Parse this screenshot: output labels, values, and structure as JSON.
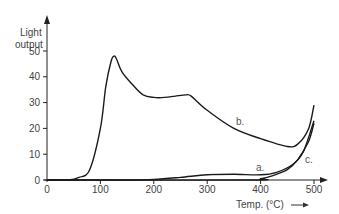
{
  "chart_data": {
    "type": "line",
    "title": "",
    "xlabel": "Temp. (°C)",
    "ylabel_line1": "Light",
    "ylabel_line2": "output",
    "xlim": [
      0,
      500
    ],
    "ylim": [
      0,
      55
    ],
    "grid": false,
    "legend": "inline curve labels",
    "x_ticks": [
      "0",
      "100",
      "200",
      "300",
      "400",
      "500"
    ],
    "y_ticks": [
      "0",
      "10",
      "20",
      "30",
      "40",
      "50"
    ],
    "series": [
      {
        "name": "a.",
        "x": [
          0,
          150,
          200,
          250,
          300,
          350,
          400,
          430,
          460,
          480,
          500
        ],
        "y": [
          0,
          0,
          0.2,
          1,
          2,
          2.2,
          2,
          3,
          6,
          11,
          23
        ]
      },
      {
        "name": "b.",
        "x": [
          0,
          40,
          60,
          80,
          100,
          110,
          120,
          125,
          130,
          140,
          160,
          180,
          200,
          220,
          240,
          260,
          270,
          300,
          350,
          400,
          450,
          470,
          490,
          500
        ],
        "y": [
          0,
          0,
          1,
          4,
          20,
          36,
          46,
          48,
          47,
          42,
          37,
          33,
          32,
          32,
          32.5,
          33,
          32.5,
          27,
          20,
          16,
          13,
          14,
          20,
          29
        ]
      },
      {
        "name": "c.",
        "x": [
          0,
          380,
          400,
          420,
          450,
          470,
          490,
          500
        ],
        "y": [
          0,
          0,
          0.5,
          1.5,
          4,
          8,
          15,
          22
        ]
      }
    ]
  }
}
